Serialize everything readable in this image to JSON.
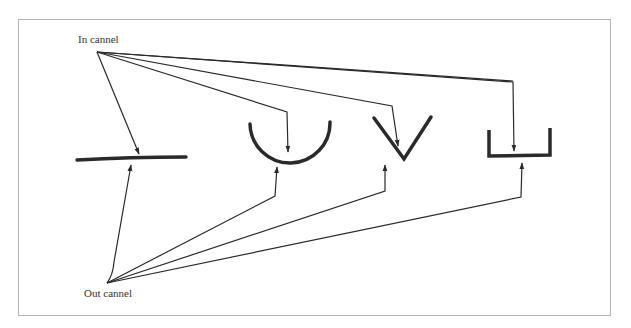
{
  "diagram": {
    "labels": {
      "in_channel": "In cannel",
      "out_channel": "Out cannel"
    },
    "shapes": [
      {
        "name": "flat",
        "description": "straight horizontal line"
      },
      {
        "name": "semicircle",
        "description": "U-shaped arc"
      },
      {
        "name": "v-shape",
        "description": "V-shaped notch"
      },
      {
        "name": "rectangular",
        "description": "rectangular channel"
      }
    ],
    "colors": {
      "stroke": "#2a2a2a",
      "border": "#b5b5b5",
      "background": "#ffffff"
    }
  }
}
